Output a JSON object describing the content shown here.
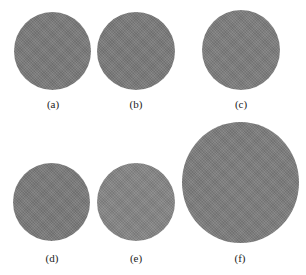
{
  "figure": {
    "panels": [
      {
        "label": "(a)",
        "shade": "#7a7a7a"
      },
      {
        "label": "(b)",
        "shade": "#7a7a7a"
      },
      {
        "label": "(c)",
        "shade": "#7d7d7d"
      },
      {
        "label": "(d)",
        "shade": "#7a7a7a"
      },
      {
        "label": "(e)",
        "shade": "#858585"
      },
      {
        "label": "(f)",
        "shade": "#7d7d7d"
      }
    ]
  }
}
